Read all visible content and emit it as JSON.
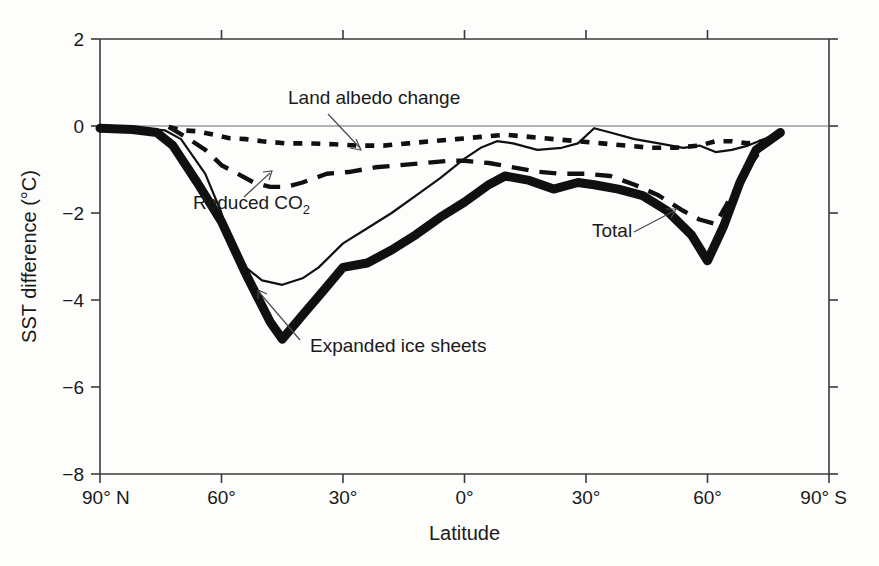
{
  "figure": {
    "background": "#fdfdfc",
    "ink_color": "#101010"
  },
  "axes": {
    "x_title": "Latitude",
    "y_title": "SST difference (°C)",
    "x_tick_labels": [
      "90° N",
      "60°",
      "30°",
      "0°",
      "30°",
      "60°",
      "90° S"
    ],
    "y_tick_labels": [
      "2",
      "0",
      "−2",
      "−4",
      "−6",
      "−8"
    ]
  },
  "annotations": {
    "albedo": {
      "label": "Land albedo change"
    },
    "co2": {
      "label": "Reduced CO",
      "sub": "2"
    },
    "ice": {
      "label": "Expanded ice sheets"
    },
    "total": {
      "label": "Total"
    }
  },
  "chart_data": {
    "type": "line",
    "title": "",
    "xlabel": "Latitude",
    "ylabel": "SST difference (°C)",
    "xlim": [
      90,
      -90
    ],
    "ylim": [
      -8,
      2
    ],
    "x_unit": "degrees latitude (positive = North, negative = South)",
    "y_unit": "°C",
    "grid": false,
    "legend": "none (series labelled by in-plot annotations)",
    "x_ticks": [
      90,
      60,
      30,
      0,
      -30,
      -60,
      -90
    ],
    "x_tick_labels": [
      "90° N",
      "60°",
      "30°",
      "0°",
      "30°",
      "60°",
      "90° S"
    ],
    "y_ticks": [
      2,
      0,
      -2,
      -4,
      -6,
      -8
    ],
    "zero_reference_line": 0,
    "series": [
      {
        "name": "Total",
        "style": "thick solid",
        "x": [
          90,
          82,
          76,
          72,
          66,
          60,
          54,
          48,
          45,
          40,
          35,
          30,
          24,
          18,
          12,
          6,
          0,
          -6,
          -10,
          -16,
          -22,
          -28,
          -32,
          -38,
          -44,
          -50,
          -56,
          -60,
          -64,
          -68,
          -72,
          -78
        ],
        "values": [
          -0.05,
          -0.08,
          -0.15,
          -0.45,
          -1.3,
          -2.2,
          -3.4,
          -4.5,
          -4.9,
          -4.35,
          -3.8,
          -3.25,
          -3.15,
          -2.85,
          -2.5,
          -2.1,
          -1.75,
          -1.35,
          -1.15,
          -1.25,
          -1.45,
          -1.3,
          -1.35,
          -1.45,
          -1.6,
          -1.95,
          -2.5,
          -3.1,
          -2.3,
          -1.3,
          -0.55,
          -0.15
        ]
      },
      {
        "name": "Expanded ice sheets",
        "style": "thin solid",
        "x": [
          90,
          80,
          74,
          70,
          64,
          60,
          56,
          50,
          45,
          40,
          36,
          30,
          24,
          18,
          12,
          6,
          0,
          -4,
          -8,
          -12,
          -18,
          -24,
          -28,
          -32,
          -36,
          -42,
          -48,
          -54,
          -58,
          -62,
          -66,
          -70,
          -74,
          -78
        ],
        "values": [
          -0.03,
          -0.05,
          -0.1,
          -0.3,
          -1.1,
          -2.0,
          -3.1,
          -3.55,
          -3.65,
          -3.5,
          -3.25,
          -2.7,
          -2.35,
          -2.0,
          -1.6,
          -1.2,
          -0.75,
          -0.5,
          -0.35,
          -0.4,
          -0.55,
          -0.5,
          -0.4,
          -0.05,
          -0.15,
          -0.3,
          -0.4,
          -0.5,
          -0.45,
          -0.6,
          -0.55,
          -0.45,
          -0.3,
          -0.15
        ]
      },
      {
        "name": "Reduced CO2",
        "style": "long dashed",
        "x": [
          73,
          68,
          64,
          60,
          56,
          52,
          48,
          44,
          40,
          34,
          28,
          22,
          16,
          10,
          4,
          0,
          -6,
          -12,
          -18,
          -24,
          -30,
          -36,
          -42,
          -48,
          -54,
          -58,
          -62,
          -66,
          -70,
          -74,
          -78
        ],
        "values": [
          -0.02,
          -0.3,
          -0.55,
          -0.9,
          -1.1,
          -1.3,
          -1.4,
          -1.4,
          -1.3,
          -1.1,
          -1.05,
          -0.95,
          -0.9,
          -0.85,
          -0.8,
          -0.8,
          -0.85,
          -0.95,
          -1.05,
          -1.1,
          -1.1,
          -1.15,
          -1.35,
          -1.6,
          -1.95,
          -2.15,
          -2.25,
          -1.6,
          -0.95,
          -0.45,
          -0.15
        ]
      },
      {
        "name": "Land albedo change",
        "style": "short dotted",
        "x": [
          73,
          70,
          66,
          62,
          58,
          54,
          50,
          44,
          38,
          32,
          26,
          20,
          14,
          8,
          2,
          -4,
          -10,
          -16,
          -22,
          -28,
          -34,
          -40,
          -46,
          -52,
          -58,
          -62,
          -66,
          -70,
          -74,
          -78
        ],
        "values": [
          -0.02,
          -0.1,
          -0.12,
          -0.2,
          -0.28,
          -0.3,
          -0.35,
          -0.4,
          -0.4,
          -0.42,
          -0.45,
          -0.45,
          -0.4,
          -0.35,
          -0.3,
          -0.25,
          -0.2,
          -0.25,
          -0.3,
          -0.35,
          -0.4,
          -0.45,
          -0.5,
          -0.5,
          -0.45,
          -0.35,
          -0.35,
          -0.4,
          -0.35,
          -0.15
        ]
      }
    ],
    "key_readings": {
      "total_minimum": {
        "value": -4.9,
        "latitude": 45
      },
      "total_southern_minimum": {
        "value": -3.1,
        "latitude": -60
      },
      "ice_sheets_minimum": {
        "value": -3.65,
        "latitude": 45
      },
      "co2_minimum_north": {
        "value": -1.4,
        "latitude": 46
      },
      "co2_minimum_south": {
        "value": -2.25,
        "latitude": -62
      },
      "albedo_range": [
        -0.5,
        0.0
      ]
    }
  }
}
